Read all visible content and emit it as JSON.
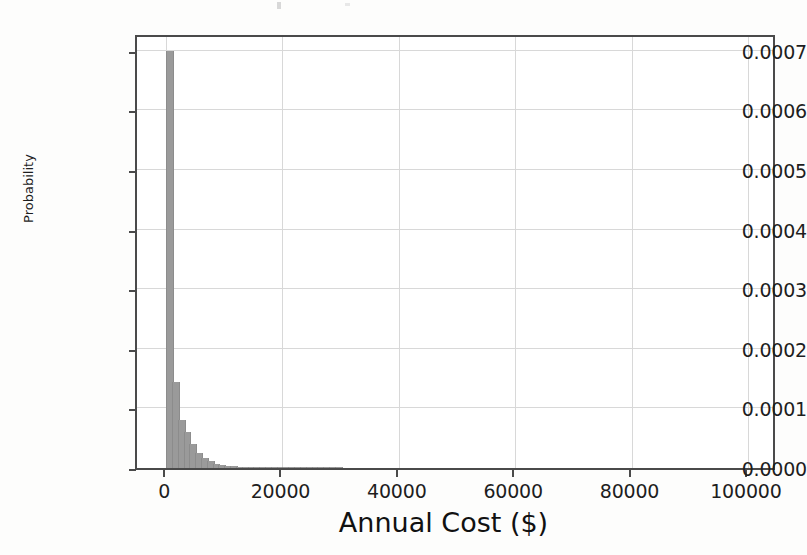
{
  "figure": {
    "background_color": "#fdfdfc",
    "plot_background_color": "#ffffff",
    "frame_color": "#4a4a4a",
    "grid_color": "#d8d8d8",
    "bar_color": "#9a9a9a"
  },
  "chart_data": {
    "type": "bar",
    "chart_subtype": "histogram",
    "title": "",
    "xlabel": "Annual Cost ($)",
    "ylabel": "Probability",
    "xlim": [
      -5000,
      105000
    ],
    "ylim": [
      0.0,
      0.00073
    ],
    "grid": true,
    "legend": false,
    "legend_position": "none",
    "xticks": [
      0,
      20000,
      40000,
      60000,
      80000,
      100000
    ],
    "xticklabels": [
      "0",
      "20000",
      "40000",
      "60000",
      "80000",
      "100000"
    ],
    "yticks": [
      0.0,
      0.0001,
      0.0002,
      0.0003,
      0.0004,
      0.0005,
      0.0006,
      0.0007
    ],
    "yticklabels": [
      "0.0000",
      "0.0001",
      "0.0002",
      "0.0003",
      "0.0004",
      "0.0005",
      "0.0006",
      "0.0007"
    ],
    "bin_width": 1000,
    "bin_edges": [
      0,
      1000,
      2000,
      3000,
      4000,
      5000,
      6000,
      7000,
      8000,
      9000,
      10000,
      11000,
      12000,
      13000,
      14000,
      15000,
      16000,
      17000,
      18000,
      19000,
      20000,
      21000,
      22000,
      23000,
      24000,
      25000,
      26000,
      27000,
      28000,
      29000,
      30000
    ],
    "bins": [
      {
        "x0": 0,
        "x1": 1000,
        "value": 0.0007
      },
      {
        "x0": 1000,
        "x1": 2000,
        "value": 0.000145
      },
      {
        "x0": 2000,
        "x1": 3000,
        "value": 8e-05
      },
      {
        "x0": 3000,
        "x1": 4000,
        "value": 6e-05
      },
      {
        "x0": 4000,
        "x1": 5000,
        "value": 4e-05
      },
      {
        "x0": 5000,
        "x1": 6000,
        "value": 2.6e-05
      },
      {
        "x0": 6000,
        "x1": 7000,
        "value": 1.6e-05
      },
      {
        "x0": 7000,
        "x1": 8000,
        "value": 1.1e-05
      },
      {
        "x0": 8000,
        "x1": 9000,
        "value": 7.5e-06
      },
      {
        "x0": 9000,
        "x1": 10000,
        "value": 5.5e-06
      },
      {
        "x0": 10000,
        "x1": 11000,
        "value": 4e-06
      },
      {
        "x0": 11000,
        "x1": 12000,
        "value": 3e-06
      },
      {
        "x0": 12000,
        "x1": 13000,
        "value": 2.4e-06
      },
      {
        "x0": 13000,
        "x1": 14000,
        "value": 1.9e-06
      },
      {
        "x0": 14000,
        "x1": 15000,
        "value": 1.5e-06
      },
      {
        "x0": 15000,
        "x1": 16000,
        "value": 1.2e-06
      },
      {
        "x0": 16000,
        "x1": 17000,
        "value": 1e-06
      },
      {
        "x0": 17000,
        "x1": 18000,
        "value": 8e-07
      },
      {
        "x0": 18000,
        "x1": 19000,
        "value": 7e-07
      },
      {
        "x0": 19000,
        "x1": 20000,
        "value": 6e-07
      },
      {
        "x0": 20000,
        "x1": 21000,
        "value": 5e-07
      },
      {
        "x0": 21000,
        "x1": 22000,
        "value": 4e-07
      },
      {
        "x0": 22000,
        "x1": 23000,
        "value": 4e-07
      },
      {
        "x0": 23000,
        "x1": 24000,
        "value": 3e-07
      },
      {
        "x0": 24000,
        "x1": 25000,
        "value": 3e-07
      },
      {
        "x0": 25000,
        "x1": 26000,
        "value": 2e-07
      },
      {
        "x0": 26000,
        "x1": 27000,
        "value": 2e-07
      },
      {
        "x0": 27000,
        "x1": 28000,
        "value": 2e-07
      },
      {
        "x0": 28000,
        "x1": 29000,
        "value": 1e-07
      },
      {
        "x0": 29000,
        "x1": 30000,
        "value": 1e-07
      }
    ]
  }
}
